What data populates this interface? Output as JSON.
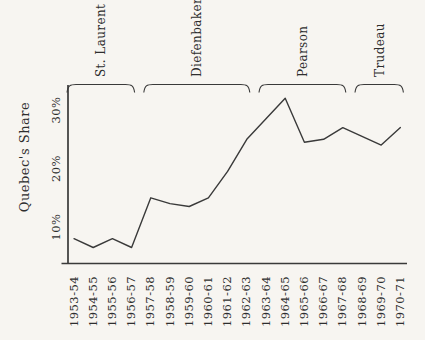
{
  "colors": {
    "background": "#f7f5f1",
    "ink": "#2e2e2e",
    "line": "#404040"
  },
  "chart_data": {
    "type": "line",
    "title": "",
    "ylabel": "Quebec's Share",
    "xlabel": "",
    "grid": false,
    "legend": null,
    "categories": [
      "1953-54",
      "1954-55",
      "1955-56",
      "1956-57",
      "1957-58",
      "1958-59",
      "1959-60",
      "1960-61",
      "1961-62",
      "1962-63",
      "1963-64",
      "1964-65",
      "1965-66",
      "1966-67",
      "1967-68",
      "1968-69",
      "1969-70",
      "1970-71"
    ],
    "values": [
      8,
      6.5,
      8,
      6.5,
      15,
      14,
      13.5,
      15,
      19.5,
      25,
      28.5,
      32,
      24.5,
      25,
      27,
      25.5,
      24,
      27
    ],
    "unit": "%",
    "y_ticks": [
      {
        "label": "10%",
        "value": 10
      },
      {
        "label": "20%",
        "value": 20
      },
      {
        "label": "30%",
        "value": 30
      }
    ],
    "ylim": [
      5,
      33
    ],
    "eras": [
      {
        "label": "St. Laurent",
        "from": "1953-54",
        "to": "1956-57"
      },
      {
        "label": "Diefenbaker",
        "from": "1957-58",
        "to": "1962-63"
      },
      {
        "label": "Pearson",
        "from": "1963-64",
        "to": "1967-68"
      },
      {
        "label": "Trudeau",
        "from": "1968-69",
        "to": "1970-71"
      }
    ]
  }
}
